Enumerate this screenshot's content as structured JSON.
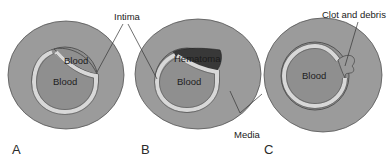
{
  "figure": {
    "panels": [
      {
        "id": "A",
        "label": "A",
        "lumen_label": "Blood",
        "false_lumen_label": "Blood"
      },
      {
        "id": "B",
        "label": "B",
        "lumen_label": "Blood",
        "false_lumen_label": "Hematoma"
      },
      {
        "id": "C",
        "label": "C",
        "lumen_label": "Blood"
      }
    ],
    "callouts": {
      "intima": "Intima",
      "media": "Media",
      "clot": "Clot and debris"
    }
  },
  "colors": {
    "media": "#9a9a9a",
    "lumen": "#8c8c8c",
    "intima": "#d6d6d6",
    "hematoma": "#3a3a3a",
    "outline": "#4a4a4a",
    "leader": "#333333"
  }
}
